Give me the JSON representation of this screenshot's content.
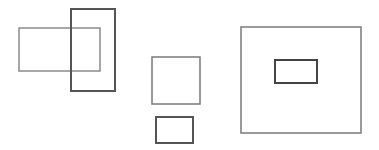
{
  "canvas": {
    "width": 379,
    "height": 150,
    "background": "#ffffff"
  },
  "shapes": [
    {
      "id": "wide-rect-left",
      "x": 19,
      "y": 28,
      "w": 81,
      "h": 43,
      "stroke": "#8a8a8a",
      "stroke_width": 1.5
    },
    {
      "id": "tall-rect-overlap",
      "x": 71,
      "y": 9,
      "w": 44,
      "h": 82,
      "stroke": "#555555",
      "stroke_width": 2
    },
    {
      "id": "square-middle",
      "x": 152,
      "y": 57,
      "w": 48,
      "h": 47,
      "stroke": "#7a7a7a",
      "stroke_width": 1.5
    },
    {
      "id": "small-rect-bottom",
      "x": 156,
      "y": 117,
      "w": 37,
      "h": 26,
      "stroke": "#555555",
      "stroke_width": 2
    },
    {
      "id": "large-rect-right",
      "x": 241,
      "y": 27,
      "w": 120,
      "h": 106,
      "stroke": "#7a7a7a",
      "stroke_width": 1.5
    },
    {
      "id": "inner-rect-right",
      "x": 275,
      "y": 60,
      "w": 42,
      "h": 23,
      "stroke": "#444444",
      "stroke_width": 2
    }
  ]
}
